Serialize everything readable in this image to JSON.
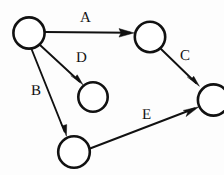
{
  "diagram": {
    "type": "directed-graph",
    "background_color": "#fdfdfd",
    "stroke_color": "#111111",
    "node_fill_color": "#ffffff",
    "nodes": [
      {
        "id": "n1",
        "label": "",
        "cx": 29,
        "cy": 33,
        "r": 16
      },
      {
        "id": "n2",
        "label": "",
        "cx": 150,
        "cy": 37,
        "r": 15.5
      },
      {
        "id": "n3",
        "label": "",
        "cx": 93,
        "cy": 97,
        "r": 15
      },
      {
        "id": "n4",
        "label": "",
        "cx": 213,
        "cy": 100,
        "r": 16
      },
      {
        "id": "n5",
        "label": "",
        "cx": 74,
        "cy": 152,
        "r": 16
      }
    ],
    "edges": [
      {
        "id": "edge-a",
        "label": "A",
        "from": "n1",
        "to": "n2",
        "label_x": 80,
        "label_y": 11,
        "x1": 45,
        "y1": 32,
        "x2": 134,
        "y2": 33
      },
      {
        "id": "edge-d",
        "label": "D",
        "from": "n1",
        "to": "n3",
        "label_x": 76,
        "label_y": 51,
        "x1": 40,
        "y1": 45,
        "x2": 82,
        "y2": 84
      },
      {
        "id": "edge-b",
        "label": "B",
        "from": "n1",
        "to": "n5",
        "label_x": 31,
        "label_y": 84,
        "x1": 31,
        "y1": 49,
        "x2": 66,
        "y2": 136
      },
      {
        "id": "edge-c",
        "label": "C",
        "from": "n2",
        "to": "n4",
        "label_x": 180,
        "label_y": 49,
        "x1": 161,
        "y1": 49,
        "x2": 199,
        "y2": 86
      },
      {
        "id": "edge-e",
        "label": "E",
        "from": "n5",
        "to": "n4",
        "label_x": 142,
        "label_y": 108,
        "x1": 90,
        "y1": 148,
        "x2": 198,
        "y2": 107
      }
    ]
  }
}
